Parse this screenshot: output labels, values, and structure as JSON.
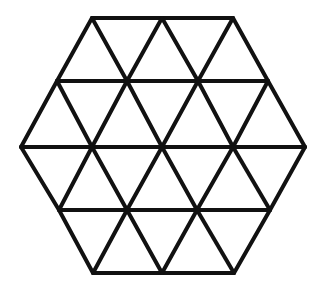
{
  "diagram": {
    "type": "triangular-grid-hexagon",
    "triangle_count": 24,
    "stroke_color": "#111111",
    "background_color": "#ffffff",
    "stroke_width": 4,
    "vertices_rows": [
      {
        "y": 18,
        "x": [
          92,
          162,
          233
        ]
      },
      {
        "y": 81,
        "x": [
          57,
          127,
          198,
          268
        ]
      },
      {
        "y": 147,
        "x": [
          21,
          92,
          162,
          233,
          305
        ]
      },
      {
        "y": 210,
        "x": [
          59,
          127,
          197,
          270
        ]
      },
      {
        "y": 273,
        "x": [
          93,
          162,
          234
        ]
      }
    ]
  }
}
